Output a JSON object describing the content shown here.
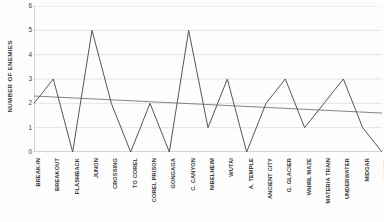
{
  "chart_data": {
    "type": "line",
    "title": "",
    "xlabel": "",
    "ylabel": "NUMBER OF ENEMIES",
    "ylim": [
      0,
      6
    ],
    "yticks": [
      0,
      1,
      2,
      3,
      4,
      5,
      6
    ],
    "grid": true,
    "legend": "none",
    "categories": [
      "BREAK-IN",
      "BREAKOUT",
      "FLASHBACK",
      "JUNON",
      "CROSSING",
      "TO COREL",
      "COREL PRISON",
      "GONGAGA",
      "C. CANYON",
      "NIBELHEIM",
      "WUTAI",
      "A. TEMPLE",
      "ANCIENT CITY",
      "G. GLACIER",
      "WHIRL MAZE",
      "MATERIA TRAIN",
      "UNDERWATER",
      "MIDGAR",
      "CRATER"
    ],
    "series": [
      {
        "name": "NUMBER OF ENEMIES",
        "type": "line",
        "color": "#555555",
        "values": [
          2,
          3,
          0,
          5,
          2,
          0,
          2,
          0,
          5,
          1,
          3,
          0,
          2,
          3,
          1,
          2,
          3,
          1,
          0
        ]
      },
      {
        "name": "Trendline",
        "type": "trendline",
        "color": "#666666",
        "endpoints": [
          2.3,
          1.6
        ]
      }
    ]
  },
  "axes": {
    "y_title": "NUMBER OF ENEMIES",
    "y_tick_labels": [
      "6",
      "5",
      "4",
      "3",
      "2",
      "1",
      "0"
    ]
  }
}
